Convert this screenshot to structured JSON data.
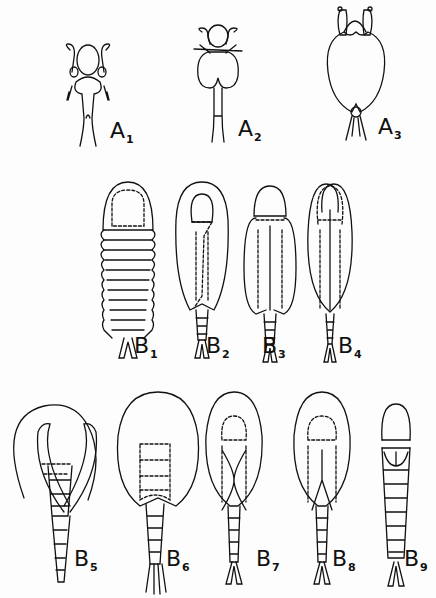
{
  "figure": {
    "row_a": [
      {
        "letter": "A",
        "sub": "1"
      },
      {
        "letter": "A",
        "sub": "2"
      },
      {
        "letter": "A",
        "sub": "3"
      }
    ],
    "row_b1": [
      {
        "letter": "B",
        "sub": "1"
      },
      {
        "letter": "B",
        "sub": "2"
      },
      {
        "letter": "B",
        "sub": "3"
      },
      {
        "letter": "B",
        "sub": "4"
      }
    ],
    "row_b2": [
      {
        "letter": "B",
        "sub": "5"
      },
      {
        "letter": "B",
        "sub": "6"
      },
      {
        "letter": "B",
        "sub": "7"
      },
      {
        "letter": "B",
        "sub": "8"
      },
      {
        "letter": "B",
        "sub": "9"
      }
    ],
    "colors": {
      "ink": "#111111",
      "background": "#fdfdfd"
    }
  }
}
